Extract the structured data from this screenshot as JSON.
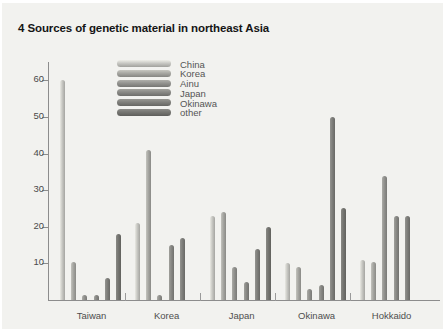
{
  "chart_data": {
    "type": "bar",
    "title": "4 Sources of genetic material in northeast Asia",
    "xlabel": "",
    "ylabel": "",
    "ylim": [
      0,
      65
    ],
    "yticks": [
      10,
      20,
      30,
      40,
      50,
      60
    ],
    "grid": false,
    "legend_position": "top-center",
    "categories": [
      "Taiwan",
      "Korea",
      "Japan",
      "Okinawa",
      "Hokkaido"
    ],
    "series": [
      {
        "name": "China",
        "color": "#c9c9c4",
        "values": [
          60,
          21,
          23,
          10,
          11
        ]
      },
      {
        "name": "Korea",
        "color": "#a8a8a3",
        "values": [
          10.5,
          41,
          24,
          9,
          10.5
        ]
      },
      {
        "name": "Ainu",
        "color": "#949490",
        "values": [
          1.5,
          1.5,
          9,
          3,
          34
        ]
      },
      {
        "name": "Japan",
        "color": "#8a8a86",
        "values": [
          1.5,
          15,
          5,
          4,
          23
        ]
      },
      {
        "name": "Okinawa",
        "color": "#80807c",
        "values": [
          6,
          17,
          14,
          50,
          23
        ]
      },
      {
        "name": "other",
        "color": "#767672",
        "values": [
          18,
          0,
          20,
          25,
          0
        ]
      }
    ]
  },
  "legend": {
    "items": [
      {
        "label": "China"
      },
      {
        "label": "Korea"
      },
      {
        "label": "Ainu"
      },
      {
        "label": "Japan"
      },
      {
        "label": "Okinawa"
      },
      {
        "label": "other"
      }
    ]
  },
  "axis": {
    "y_labels": [
      "60",
      "50",
      "40",
      "30",
      "20",
      "10"
    ]
  }
}
